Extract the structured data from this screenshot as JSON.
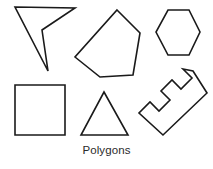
{
  "figure": {
    "caption": "Polygons",
    "background_color": "#ffffff",
    "stroke_color": "#1a1a1a",
    "caption_color": "#2b2b2b",
    "width": 213,
    "height": 169
  },
  "shapes": [
    {
      "id": "dart",
      "label": "concave-quadrilateral-dart",
      "sides": 4,
      "points": "15,7 75,8 42,30 48,71"
    },
    {
      "id": "pentagon",
      "label": "irregular-pentagon",
      "sides": 5,
      "points": "117,10 140,33 133,75 100,77 75,57"
    },
    {
      "id": "hexagon",
      "label": "regular-hexagon",
      "sides": 6,
      "points": "168,10 189,10 200,32 189,55 168,55 156,32"
    },
    {
      "id": "square",
      "label": "square",
      "sides": 4,
      "points": "15,85 65,85 65,135 15,135"
    },
    {
      "id": "triangle",
      "label": "isosceles-triangle",
      "sides": 3,
      "points": "104,92 128,135 81,135"
    },
    {
      "id": "comb",
      "label": "rotated-comb-polygon",
      "sides": 16,
      "points": "193,71 207,93 163,135 139,113 150,102 159,111 170,100 161,91 172,80 181,89 192,78 183,69"
    }
  ]
}
